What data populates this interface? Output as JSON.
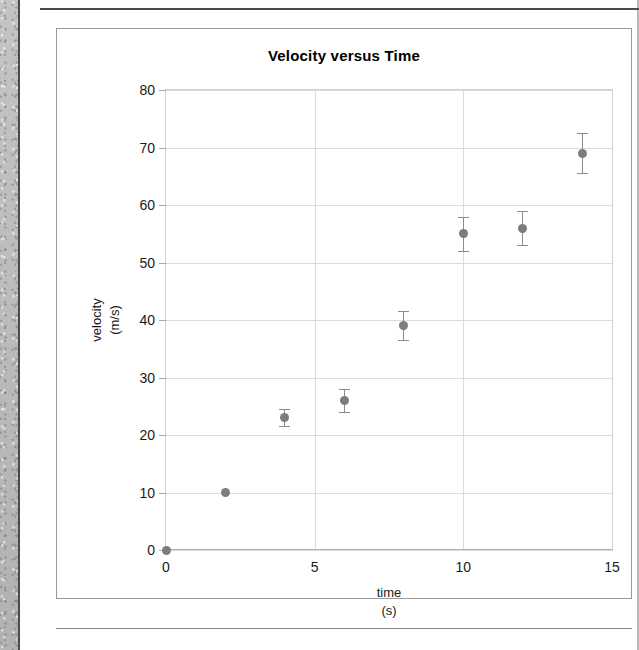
{
  "document": {
    "title": "Velocity versus Time"
  },
  "chart_data": {
    "type": "scatter",
    "title": "Velocity versus Time",
    "xlabel": "time",
    "xlabel_units": "(s)",
    "ylabel": "velocity",
    "ylabel_units": "(m/s)",
    "xlim": [
      0,
      15
    ],
    "ylim": [
      0,
      80
    ],
    "grid": true,
    "legend": "none",
    "marker_color": "#7d7d7d",
    "errorbar_color": "#8c8c8c",
    "xticks": [
      0,
      5,
      10,
      15
    ],
    "xtick_labels": [
      "0",
      "5",
      "10",
      "15"
    ],
    "yticks": [
      0,
      10,
      20,
      30,
      40,
      50,
      60,
      70,
      80
    ],
    "ytick_labels": [
      "0",
      "10",
      "20",
      "30",
      "40",
      "50",
      "60",
      "70",
      "80"
    ],
    "x": [
      0,
      2,
      4,
      6,
      8,
      10,
      12,
      14
    ],
    "y": [
      0,
      10,
      23,
      26,
      39,
      55,
      56,
      69
    ],
    "yerr": [
      0,
      0,
      1.5,
      2,
      2.5,
      3,
      3,
      3.5
    ],
    "points": [
      {
        "x": 0,
        "y": 0,
        "yerr": 0
      },
      {
        "x": 2,
        "y": 10,
        "yerr": 0
      },
      {
        "x": 4,
        "y": 23,
        "yerr": 1.5
      },
      {
        "x": 6,
        "y": 26,
        "yerr": 2
      },
      {
        "x": 8,
        "y": 39,
        "yerr": 2.5
      },
      {
        "x": 10,
        "y": 55,
        "yerr": 3
      },
      {
        "x": 12,
        "y": 56,
        "yerr": 3
      },
      {
        "x": 14,
        "y": 69,
        "yerr": 3.5
      }
    ]
  }
}
